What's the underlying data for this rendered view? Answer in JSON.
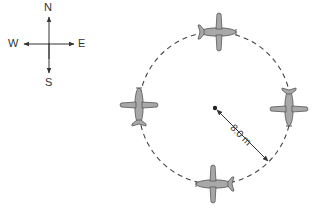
{
  "compass": {
    "north": "N",
    "south": "S",
    "east": "E",
    "west": "W"
  },
  "circle": {
    "radius_label": "8.0 m",
    "path_style": "dashed"
  },
  "airplanes": [
    {
      "position": "top",
      "heading": "east"
    },
    {
      "position": "right",
      "heading": "south"
    },
    {
      "position": "bottom",
      "heading": "west"
    },
    {
      "position": "left",
      "heading": "north"
    }
  ],
  "colors": {
    "line": "#333333",
    "plane_fill": "#a8a8a8",
    "plane_stroke": "#555555"
  }
}
